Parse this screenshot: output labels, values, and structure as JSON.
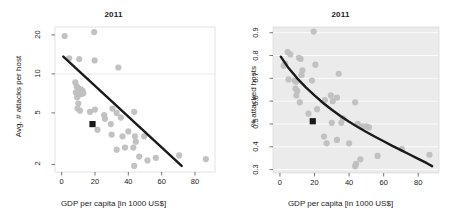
{
  "figure": {
    "background_color": "#ffffff",
    "point_color": "#bfbfbf",
    "marker_color": "#1a1a1a",
    "fit_line_color": "#1a1a1a",
    "panel_bg_left": "#ffffff",
    "panel_bg_right": "#ebebeb",
    "gridline_color_left": "#e4e4e4",
    "gridline_color_right": "#ffffff"
  },
  "chart_data": [
    {
      "type": "scatter",
      "id": "left",
      "title": "2011",
      "xlabel": "GDP per capita [in 1000 US$]",
      "ylabel": "Avg. # attacks per host",
      "xlim": [
        -4,
        92
      ],
      "ylim_log": [
        1.75,
        23
      ],
      "yscale": "log",
      "grid": true,
      "xticks": [
        0,
        20,
        40,
        60,
        80
      ],
      "yticks": [
        2,
        5,
        10,
        20
      ],
      "gridlines_y": [
        10
      ],
      "legend": "none",
      "points": [
        [
          1.8,
          19.6
        ],
        [
          19.5,
          21.0
        ],
        [
          4.5,
          13.2
        ],
        [
          10.5,
          13.0
        ],
        [
          19.8,
          12.7
        ],
        [
          34.0,
          11.2
        ],
        [
          8.2,
          8.6
        ],
        [
          9.0,
          8.0
        ],
        [
          9.8,
          7.8
        ],
        [
          8.5,
          7.2
        ],
        [
          11.5,
          7.6
        ],
        [
          12.5,
          7.4
        ],
        [
          10.2,
          6.9
        ],
        [
          9.3,
          6.6
        ],
        [
          10.0,
          5.9
        ],
        [
          11.8,
          7.0
        ],
        [
          13.0,
          7.1
        ],
        [
          9.5,
          5.4
        ],
        [
          11.0,
          5.2
        ],
        [
          17.0,
          5.1
        ],
        [
          20.0,
          5.3
        ],
        [
          26.0,
          4.5
        ],
        [
          30.5,
          5.4
        ],
        [
          33.0,
          5.0
        ],
        [
          35.5,
          4.6
        ],
        [
          43.5,
          5.1
        ],
        [
          21.5,
          3.7
        ],
        [
          30.0,
          3.4
        ],
        [
          36.5,
          3.3
        ],
        [
          40.0,
          3.6
        ],
        [
          44.0,
          3.3
        ],
        [
          44.5,
          3.0
        ],
        [
          49.5,
          3.3
        ],
        [
          33.0,
          2.6
        ],
        [
          38.0,
          2.7
        ],
        [
          43.0,
          2.7
        ],
        [
          43.5,
          1.95
        ],
        [
          46.5,
          2.3
        ],
        [
          51.5,
          2.15
        ],
        [
          56.5,
          2.25
        ],
        [
          70.5,
          2.35
        ],
        [
          86.5,
          2.2
        ],
        [
          25.5,
          4.8
        ],
        [
          29.5,
          4.1
        ]
      ],
      "highlight_point": {
        "x": 18.5,
        "y": 4.1,
        "shape": "square",
        "label": ""
      },
      "fit_line": {
        "type": "linear-on-log",
        "x_start": 1.0,
        "y_start": 13.6,
        "x_end": 72.0,
        "y_end": 1.95
      }
    },
    {
      "type": "scatter",
      "id": "right",
      "title": "2011",
      "xlabel": "GDP per capita [in 1000 US$]",
      "ylabel": "% attacked hosts",
      "xlim": [
        -4,
        92
      ],
      "ylim": [
        0.285,
        0.925
      ],
      "yscale": "linear",
      "grid": true,
      "xticks": [
        0,
        20,
        40,
        60,
        80
      ],
      "yticks": [
        0.3,
        0.4,
        0.5,
        0.6,
        0.7,
        0.8,
        0.9
      ],
      "legend": "none",
      "points": [
        [
          19.5,
          0.905
        ],
        [
          4.5,
          0.815
        ],
        [
          6.0,
          0.805
        ],
        [
          11.0,
          0.79
        ],
        [
          12.0,
          0.785
        ],
        [
          3.0,
          0.765
        ],
        [
          2.2,
          0.755
        ],
        [
          20.5,
          0.76
        ],
        [
          13.0,
          0.735
        ],
        [
          12.5,
          0.715
        ],
        [
          34.0,
          0.72
        ],
        [
          5.0,
          0.695
        ],
        [
          8.5,
          0.69
        ],
        [
          9.3,
          0.685
        ],
        [
          18.5,
          0.69
        ],
        [
          9.0,
          0.655
        ],
        [
          10.0,
          0.645
        ],
        [
          9.5,
          0.625
        ],
        [
          29.5,
          0.625
        ],
        [
          33.0,
          0.615
        ],
        [
          30.5,
          0.6
        ],
        [
          43.5,
          0.595
        ],
        [
          11.5,
          0.595
        ],
        [
          21.5,
          0.565
        ],
        [
          26.0,
          0.605
        ],
        [
          36.5,
          0.525
        ],
        [
          35.5,
          0.505
        ],
        [
          45.0,
          0.5
        ],
        [
          47.5,
          0.49
        ],
        [
          50.0,
          0.49
        ],
        [
          51.5,
          0.485
        ],
        [
          30.0,
          0.505
        ],
        [
          25.5,
          0.445
        ],
        [
          33.0,
          0.43
        ],
        [
          27.0,
          0.415
        ],
        [
          40.0,
          0.415
        ],
        [
          44.0,
          0.325
        ],
        [
          43.5,
          0.315
        ],
        [
          46.5,
          0.345
        ],
        [
          56.5,
          0.36
        ],
        [
          70.5,
          0.39
        ],
        [
          86.5,
          0.365
        ],
        [
          16.5,
          0.545
        ]
      ],
      "highlight_point": {
        "x": 19.0,
        "y": 0.512,
        "shape": "square",
        "label": ""
      },
      "fit_line": {
        "type": "curve-decay",
        "points": [
          [
            0.5,
            0.795
          ],
          [
            5,
            0.745
          ],
          [
            10,
            0.7
          ],
          [
            15,
            0.66
          ],
          [
            20,
            0.625
          ],
          [
            25,
            0.592
          ],
          [
            30,
            0.562
          ],
          [
            35,
            0.535
          ],
          [
            40,
            0.51
          ],
          [
            45,
            0.487
          ],
          [
            50,
            0.465
          ],
          [
            55,
            0.444
          ],
          [
            60,
            0.424
          ],
          [
            65,
            0.404
          ],
          [
            70,
            0.385
          ],
          [
            75,
            0.366
          ],
          [
            80,
            0.347
          ],
          [
            85,
            0.328
          ],
          [
            88,
            0.315
          ]
        ]
      }
    }
  ]
}
